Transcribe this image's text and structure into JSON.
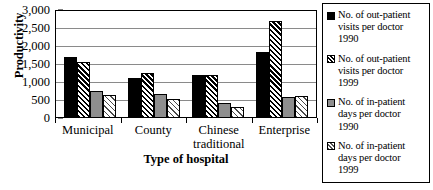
{
  "chart_data": {
    "type": "bar",
    "title": "",
    "xlabel": "Type of hospital",
    "ylabel": "Productivity",
    "categories": [
      "Municipal",
      "County",
      "Chinese\ntraditional",
      "Enterprise"
    ],
    "ylim": [
      0,
      3000
    ],
    "yticks": [
      0,
      500,
      1000,
      1500,
      2000,
      2500,
      3000
    ],
    "ytick_labels": [
      "0",
      "500",
      "1,000",
      "1,500",
      "2,000",
      "2,500",
      "3,000"
    ],
    "grid": true,
    "legend_position": "right",
    "series": [
      {
        "name": "No. of out-patient\nvisits per doctor\n1990",
        "pattern": "solid-black",
        "color": "#000000",
        "values": [
          1680,
          1080,
          1170,
          1800
        ]
      },
      {
        "name": "No. of out-patient\nvisits per doctor\n1999",
        "pattern": "dense-diagonal-hatch",
        "color": "#000000",
        "values": [
          1540,
          1210,
          1170,
          2660
        ]
      },
      {
        "name": "No. of in-patient\ndays per doctor\n1990",
        "pattern": "solid-gray",
        "color": "#8e8e8e",
        "values": [
          710,
          650,
          380,
          550
        ]
      },
      {
        "name": "No. of in-patient\ndays per doctor\n1999",
        "pattern": "light-diagonal-hatch",
        "color": "#ffffff",
        "values": [
          600,
          490,
          280,
          570
        ]
      }
    ]
  }
}
